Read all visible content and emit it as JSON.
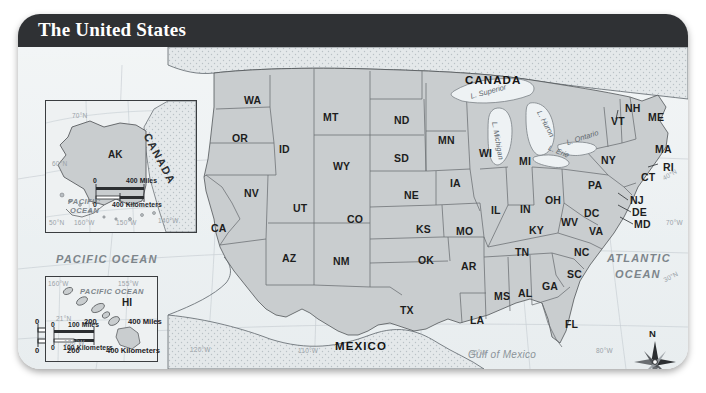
{
  "header": {
    "title": "The United States"
  },
  "map": {
    "countries": [
      {
        "name": "CANADA",
        "x": 447,
        "y": 27
      },
      {
        "name": "MEXICO",
        "x": 317,
        "y": 293
      }
    ],
    "oceans": [
      {
        "name": "PACIFIC OCEAN",
        "x": 38,
        "y": 206
      },
      {
        "name": "ATLANTIC OCEAN",
        "line1": "ATLANTIC",
        "line2": "OCEAN",
        "x": 589,
        "y": 212
      }
    ],
    "water_bodies": [
      {
        "name": "Gulf of Mexico",
        "x": 455,
        "y": 307
      },
      {
        "name": "L. Superior",
        "x": 459,
        "y": 46
      },
      {
        "name": "L. Michigan",
        "x": 489,
        "y": 84
      },
      {
        "name": "L. Huron",
        "x": 531,
        "y": 70
      },
      {
        "name": "L. Ontario",
        "x": 556,
        "y": 92
      },
      {
        "name": "L. Erie",
        "x": 540,
        "y": 104
      }
    ],
    "states": [
      {
        "code": "WA",
        "x": 226,
        "y": 47
      },
      {
        "code": "OR",
        "x": 214,
        "y": 85
      },
      {
        "code": "ID",
        "x": 261,
        "y": 96
      },
      {
        "code": "MT",
        "x": 305,
        "y": 64
      },
      {
        "code": "WY",
        "x": 315,
        "y": 113
      },
      {
        "code": "ND",
        "x": 376,
        "y": 67
      },
      {
        "code": "SD",
        "x": 376,
        "y": 105
      },
      {
        "code": "NE",
        "x": 386,
        "y": 142
      },
      {
        "code": "MN",
        "x": 420,
        "y": 87
      },
      {
        "code": "IA",
        "x": 432,
        "y": 130
      },
      {
        "code": "WI",
        "x": 461,
        "y": 100
      },
      {
        "code": "MI",
        "x": 501,
        "y": 108
      },
      {
        "code": "NV",
        "x": 226,
        "y": 140
      },
      {
        "code": "UT",
        "x": 275,
        "y": 155
      },
      {
        "code": "CO",
        "x": 329,
        "y": 166
      },
      {
        "code": "KS",
        "x": 398,
        "y": 176
      },
      {
        "code": "MO",
        "x": 438,
        "y": 178
      },
      {
        "code": "IL",
        "x": 473,
        "y": 157
      },
      {
        "code": "IN",
        "x": 502,
        "y": 156
      },
      {
        "code": "OH",
        "x": 527,
        "y": 147
      },
      {
        "code": "CA",
        "x": 193,
        "y": 175
      },
      {
        "code": "AZ",
        "x": 264,
        "y": 205
      },
      {
        "code": "NM",
        "x": 315,
        "y": 208
      },
      {
        "code": "OK",
        "x": 400,
        "y": 207
      },
      {
        "code": "AR",
        "x": 443,
        "y": 213
      },
      {
        "code": "KY",
        "x": 511,
        "y": 177
      },
      {
        "code": "TN",
        "x": 497,
        "y": 199
      },
      {
        "code": "WV",
        "x": 543,
        "y": 169
      },
      {
        "code": "VA",
        "x": 571,
        "y": 178
      },
      {
        "code": "NC",
        "x": 556,
        "y": 199
      },
      {
        "code": "SC",
        "x": 549,
        "y": 221
      },
      {
        "code": "GA",
        "x": 524,
        "y": 233
      },
      {
        "code": "AL",
        "x": 500,
        "y": 240
      },
      {
        "code": "MS",
        "x": 476,
        "y": 243
      },
      {
        "code": "LA",
        "x": 452,
        "y": 267
      },
      {
        "code": "TX",
        "x": 382,
        "y": 257
      },
      {
        "code": "FL",
        "x": 547,
        "y": 271
      },
      {
        "code": "PA",
        "x": 570,
        "y": 132
      },
      {
        "code": "NY",
        "x": 583,
        "y": 107
      },
      {
        "code": "VT",
        "x": 593,
        "y": 68
      },
      {
        "code": "NH",
        "x": 607,
        "y": 57
      },
      {
        "code": "ME",
        "x": 630,
        "y": 65
      },
      {
        "code": "MA",
        "x": 638,
        "y": 97
      },
      {
        "code": "RI",
        "x": 644,
        "y": 116
      },
      {
        "code": "CT",
        "x": 624,
        "y": 124
      },
      {
        "code": "NJ",
        "x": 612,
        "y": 152
      },
      {
        "code": "DE",
        "x": 615,
        "y": 164
      },
      {
        "code": "MD",
        "x": 617,
        "y": 176
      },
      {
        "code": "DC",
        "x": 570,
        "y": 167
      }
    ],
    "grid_labels": [
      {
        "text": "40°N",
        "x": 646,
        "y": 126
      },
      {
        "text": "70°W",
        "x": 654,
        "y": 174
      },
      {
        "text": "30°N",
        "x": 651,
        "y": 256
      },
      {
        "text": "80°W",
        "x": 582,
        "y": 331
      },
      {
        "text": "90°W",
        "x": 455,
        "y": 333
      },
      {
        "text": "110°W",
        "x": 284,
        "y": 331
      },
      {
        "text": "120°W",
        "x": 178,
        "y": 330
      },
      {
        "text": "130°W",
        "x": 53,
        "y": 323
      }
    ],
    "scale_bar": {
      "miles_label": "400 Miles",
      "km_label": "400 Kilometers",
      "ticks_miles": [
        "0",
        "200"
      ],
      "ticks_km": [
        "0",
        "200"
      ]
    },
    "compass": {
      "north_label": "N"
    }
  },
  "inset_alaska": {
    "state": "AK",
    "country": "CANADA",
    "ocean_line1": "PACIFIC",
    "ocean_line2": "OCEAN",
    "grid_labels": [
      {
        "text": "70°N",
        "x": 26,
        "y": 11
      },
      {
        "text": "60°N",
        "x": 8,
        "y": 59
      },
      {
        "text": "50°N",
        "x": 4,
        "y": 119
      },
      {
        "text": "160°W",
        "x": 30,
        "y": 119
      },
      {
        "text": "150°W",
        "x": 72,
        "y": 119
      },
      {
        "text": "140°W",
        "x": 115,
        "y": 117
      }
    ],
    "scale": {
      "zero": "0",
      "miles": "400 Miles",
      "km": "400 Kilometers"
    }
  },
  "inset_hawaii": {
    "state": "HI",
    "ocean": "PACIFIC OCEAN",
    "grid_labels": [
      {
        "text": "160°W",
        "x": 3,
        "y": 3
      },
      {
        "text": "155°W",
        "x": 72,
        "y": 3
      },
      {
        "text": "21°N",
        "x": 10,
        "y": 41
      }
    ],
    "scale": {
      "zero": "0",
      "miles": "100 Miles",
      "km": "100 Kilometers"
    }
  }
}
